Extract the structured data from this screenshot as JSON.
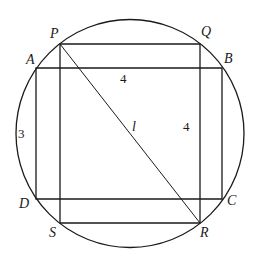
{
  "diagram": {
    "circle": {
      "cx": 130,
      "cy": 133.5,
      "r": 114
    },
    "rect_PQRS": {
      "P": [
        60,
        44
      ],
      "Q": [
        200,
        44
      ],
      "R": [
        200,
        223
      ],
      "S": [
        60,
        223
      ]
    },
    "rect_ABCD": {
      "A": [
        36,
        68
      ],
      "B": [
        222,
        68
      ],
      "C": [
        222,
        199
      ],
      "D": [
        36,
        199
      ]
    },
    "diagonal": {
      "from": "P",
      "to": "R",
      "label": "l"
    },
    "point_labels": {
      "P": "P",
      "Q": "Q",
      "R": "R",
      "S": "S",
      "A": "A",
      "B": "B",
      "C": "C",
      "D": "D"
    },
    "measurements": {
      "top_width": "4",
      "left_height": "3",
      "right_height": "4",
      "diagonal": "l"
    },
    "colors": {
      "stroke": "#1a1a1a",
      "background": "#ffffff"
    }
  }
}
